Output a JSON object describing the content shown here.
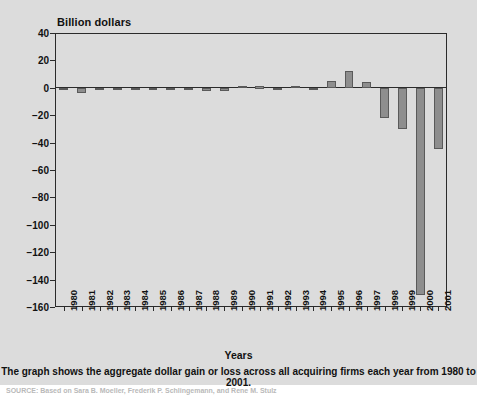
{
  "figure": {
    "y_axis_title": "Billion dollars",
    "x_axis_title": "Years",
    "caption": "The graph shows the aggregate dollar gain or loss across all acquiring firms each year from 1980 to 2001.",
    "source_note": "SOURCE: Based on Sara B. Moeller, Frederik P. Schlingemann, and Rene M. Stulz"
  },
  "colors": {
    "background": "#dcdcdc",
    "bar_fill": "#8e8e8e",
    "bar_stroke": "#5a5a5a",
    "axis": "#2b2b2b",
    "text": "#111111"
  },
  "chart_data": {
    "type": "bar",
    "title": "",
    "subtitle": "",
    "xlabel": "Years",
    "ylabel": "Billion dollars",
    "ylim": [
      -160,
      40
    ],
    "ytick_values": [
      40,
      20,
      0,
      -20,
      -40,
      -60,
      -80,
      -100,
      -120,
      -140,
      -160
    ],
    "ytick_labels": [
      "40",
      "20",
      "0",
      "−20",
      "−40",
      "−60",
      "−80",
      "−100",
      "−120",
      "−140",
      "−160"
    ],
    "grid": false,
    "legend": null,
    "categories": [
      "1980",
      "1981",
      "1982",
      "1983",
      "1984",
      "1985",
      "1986",
      "1987",
      "1988",
      "1989",
      "1990",
      "1991",
      "1992",
      "1993",
      "1994",
      "1995",
      "1996",
      "1997",
      "1998",
      "1999",
      "2000",
      "2001"
    ],
    "values": [
      -1.5,
      -4.0,
      -0.5,
      -0.5,
      -0.5,
      -0.5,
      -0.5,
      -1.5,
      -2.0,
      -2.0,
      1.5,
      1.0,
      -0.5,
      1.5,
      -1.5,
      5.0,
      12.0,
      4.5,
      -22.0,
      -30.0,
      -151.0,
      -45.0
    ]
  }
}
